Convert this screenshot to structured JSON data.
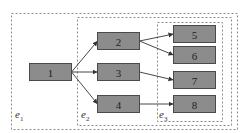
{
  "diagram": {
    "type": "nested-region flow graph",
    "regions": [
      {
        "id": "e1",
        "label": "e",
        "subscript": "1"
      },
      {
        "id": "e2",
        "label": "e",
        "subscript": "2"
      },
      {
        "id": "e3",
        "label": "e",
        "subscript": "3"
      }
    ],
    "nodes": [
      {
        "id": "n1",
        "label": "1"
      },
      {
        "id": "n2",
        "label": "2"
      },
      {
        "id": "n3",
        "label": "3"
      },
      {
        "id": "n4",
        "label": "4"
      },
      {
        "id": "n5",
        "label": "5"
      },
      {
        "id": "n6",
        "label": "6"
      },
      {
        "id": "n7",
        "label": "7"
      },
      {
        "id": "n8",
        "label": "8"
      }
    ],
    "edges": [
      {
        "from": "n1",
        "to": "n2"
      },
      {
        "from": "n1",
        "to": "n3"
      },
      {
        "from": "n1",
        "to": "n4"
      },
      {
        "from": "n2",
        "to": "n5"
      },
      {
        "from": "n2",
        "to": "n6"
      },
      {
        "from": "n3",
        "to": "n7"
      },
      {
        "from": "n4",
        "to": "n8"
      }
    ],
    "colors": {
      "node_fill": "#8c8c8c",
      "node_stroke": "#4a4a4a",
      "region_stroke": "#8a8a8a",
      "edge": "#333333"
    }
  }
}
